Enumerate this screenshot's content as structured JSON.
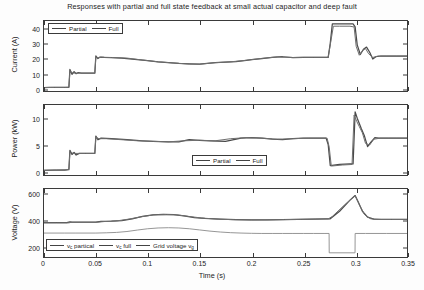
{
  "figure": {
    "title": "Responses with partial and full state feedback at small actual capacitor and deep fault",
    "xlabel": "Time (s)",
    "xticks": [
      "0",
      "0.05",
      "0.1",
      "0.15",
      "0.2",
      "0.25",
      "0.3",
      "0.35"
    ],
    "xlim": [
      0,
      0.35
    ],
    "colors": {
      "partial": "#4a4a4a",
      "full": "#6e6e6e",
      "grid": "#8a8a8a",
      "axis": "#3a3a3a"
    }
  },
  "chart_data": [
    {
      "type": "line",
      "id": "current",
      "title": "Responses with partial and full state feedback at small actual capacitor and deep fault",
      "xlabel": "Time (s)",
      "ylabel": "Current (A)",
      "xlim": [
        0,
        0.35
      ],
      "ylim": [
        -2,
        45
      ],
      "yticks": [
        0,
        10,
        20,
        30,
        40
      ],
      "grid": false,
      "legend_position": "top-left",
      "series": [
        {
          "name": "Partial",
          "x": [
            0,
            0.005,
            0.01,
            0.02,
            0.024,
            0.025,
            0.027,
            0.029,
            0.031,
            0.033,
            0.036,
            0.04,
            0.045,
            0.049,
            0.05,
            0.052,
            0.054,
            0.058,
            0.065,
            0.075,
            0.085,
            0.095,
            0.1,
            0.11,
            0.12,
            0.13,
            0.14,
            0.15,
            0.155,
            0.165,
            0.175,
            0.185,
            0.195,
            0.2,
            0.21,
            0.22,
            0.23,
            0.24,
            0.25,
            0.26,
            0.27,
            0.274,
            0.276,
            0.278,
            0.282,
            0.29,
            0.298,
            0.3,
            0.302,
            0.305,
            0.308,
            0.311,
            0.314,
            0.317,
            0.32,
            0.325,
            0.33,
            0.34,
            0.35
          ],
          "y": [
            0.3,
            0.4,
            0.4,
            0.4,
            0.5,
            12.5,
            9.2,
            11.0,
            9.6,
            10.3,
            10.0,
            10.0,
            10.0,
            10.0,
            21.5,
            19.8,
            20.8,
            20.6,
            20.4,
            20.0,
            19.4,
            18.8,
            18.4,
            17.6,
            17.0,
            16.5,
            16.2,
            16.0,
            16.4,
            17.0,
            17.4,
            17.8,
            18.6,
            19.0,
            19.8,
            20.6,
            21.0,
            20.4,
            20.6,
            20.6,
            20.6,
            20.6,
            30.0,
            43.0,
            43.0,
            43.0,
            43.0,
            41.0,
            29.0,
            22.5,
            26.0,
            27.5,
            24.0,
            19.5,
            21.0,
            21.5,
            21.5,
            21.5,
            21.5
          ]
        },
        {
          "name": "Full",
          "x": [
            0,
            0.01,
            0.02,
            0.024,
            0.025,
            0.027,
            0.03,
            0.035,
            0.045,
            0.049,
            0.05,
            0.052,
            0.055,
            0.065,
            0.08,
            0.095,
            0.11,
            0.125,
            0.14,
            0.15,
            0.165,
            0.18,
            0.195,
            0.21,
            0.225,
            0.24,
            0.25,
            0.26,
            0.27,
            0.274,
            0.276,
            0.279,
            0.285,
            0.295,
            0.299,
            0.301,
            0.304,
            0.307,
            0.31,
            0.313,
            0.317,
            0.322,
            0.33,
            0.34,
            0.35
          ],
          "y": [
            0.3,
            0.4,
            0.4,
            0.5,
            11.8,
            10.2,
            10.0,
            10.0,
            10.0,
            10.0,
            21.0,
            20.2,
            20.7,
            20.5,
            20.1,
            18.8,
            17.6,
            16.8,
            16.1,
            16.0,
            17.0,
            17.6,
            18.6,
            19.9,
            20.9,
            20.5,
            20.6,
            20.6,
            20.6,
            20.6,
            29.0,
            41.5,
            41.5,
            41.5,
            41.0,
            28.0,
            22.0,
            25.0,
            26.5,
            23.0,
            20.5,
            21.5,
            21.5,
            21.5,
            21.5
          ]
        }
      ]
    },
    {
      "type": "line",
      "id": "power",
      "xlabel": "Time (s)",
      "ylabel": "Power (kW)",
      "xlim": [
        0,
        0.35
      ],
      "ylim": [
        -0.8,
        12.5
      ],
      "yticks": [
        0,
        5,
        10
      ],
      "grid": false,
      "legend_position": "bottom-right",
      "series": [
        {
          "name": "Partial",
          "x": [
            0,
            0.01,
            0.02,
            0.024,
            0.025,
            0.027,
            0.029,
            0.031,
            0.034,
            0.04,
            0.047,
            0.049,
            0.05,
            0.052,
            0.055,
            0.065,
            0.08,
            0.095,
            0.105,
            0.12,
            0.13,
            0.14,
            0.15,
            0.16,
            0.175,
            0.19,
            0.2,
            0.21,
            0.22,
            0.23,
            0.24,
            0.25,
            0.26,
            0.268,
            0.272,
            0.274,
            0.276,
            0.285,
            0.295,
            0.298,
            0.3,
            0.302,
            0.304,
            0.306,
            0.309,
            0.312,
            0.315,
            0.319,
            0.323,
            0.33,
            0.34,
            0.35
          ],
          "y": [
            0.1,
            0.15,
            0.15,
            0.2,
            3.9,
            3.1,
            3.5,
            3.0,
            3.3,
            3.3,
            3.3,
            3.3,
            6.6,
            5.9,
            6.2,
            6.1,
            5.9,
            5.7,
            5.6,
            5.5,
            5.5,
            5.9,
            5.8,
            5.7,
            5.6,
            6.2,
            6.3,
            6.2,
            6.0,
            5.9,
            6.1,
            6.2,
            6.2,
            6.2,
            6.2,
            5.0,
            1.0,
            1.2,
            1.3,
            1.3,
            11.2,
            10.0,
            9.0,
            8.0,
            6.6,
            4.6,
            5.4,
            6.3,
            6.2,
            6.2,
            6.2,
            6.2
          ]
        },
        {
          "name": "Full",
          "x": [
            0,
            0.012,
            0.022,
            0.024,
            0.025,
            0.028,
            0.032,
            0.04,
            0.049,
            0.05,
            0.053,
            0.06,
            0.075,
            0.09,
            0.105,
            0.12,
            0.135,
            0.15,
            0.165,
            0.18,
            0.195,
            0.21,
            0.225,
            0.24,
            0.255,
            0.268,
            0.273,
            0.275,
            0.277,
            0.288,
            0.297,
            0.299,
            0.3015,
            0.304,
            0.307,
            0.31,
            0.314,
            0.318,
            0.324,
            0.332,
            0.34,
            0.35
          ],
          "y": [
            0.1,
            0.15,
            0.2,
            0.3,
            3.6,
            3.3,
            3.3,
            3.3,
            3.3,
            6.4,
            6.1,
            6.1,
            5.9,
            5.7,
            5.6,
            5.5,
            5.7,
            5.8,
            5.7,
            6.1,
            6.3,
            6.2,
            6.0,
            6.1,
            6.2,
            6.2,
            6.2,
            4.5,
            0.9,
            1.1,
            1.2,
            10.6,
            9.4,
            8.4,
            7.2,
            5.2,
            4.9,
            6.0,
            6.2,
            6.2,
            6.2,
            6.2
          ]
        }
      ]
    },
    {
      "type": "line",
      "id": "voltage",
      "xlabel": "Time (s)",
      "ylabel": "Voltage (V)",
      "xlim": [
        0,
        0.35
      ],
      "ylim": [
        120,
        640
      ],
      "yticks": [
        200,
        400,
        600
      ],
      "grid": false,
      "legend_position": "bottom-left",
      "series": [
        {
          "name": "v_c partical",
          "label_main": "v",
          "label_sub": "c",
          "label_tail": " partical",
          "x": [
            0,
            0.01,
            0.022,
            0.025,
            0.027,
            0.035,
            0.05,
            0.055,
            0.065,
            0.075,
            0.085,
            0.095,
            0.105,
            0.115,
            0.125,
            0.135,
            0.145,
            0.155,
            0.17,
            0.185,
            0.2,
            0.215,
            0.23,
            0.245,
            0.26,
            0.272,
            0.276,
            0.285,
            0.295,
            0.3,
            0.303,
            0.307,
            0.312,
            0.318,
            0.33,
            0.34,
            0.35
          ],
          "y": [
            383,
            383,
            383,
            388,
            386,
            386,
            386,
            392,
            394,
            398,
            412,
            430,
            443,
            446,
            444,
            435,
            422,
            415,
            410,
            406,
            404,
            404,
            406,
            408,
            410,
            412,
            412,
            470,
            555,
            590,
            540,
            470,
            425,
            410,
            408,
            408,
            408
          ]
        },
        {
          "name": "v_c full",
          "label_main": "v",
          "label_sub": "c",
          "label_tail": " full",
          "x": [
            0,
            0.012,
            0.024,
            0.026,
            0.034,
            0.05,
            0.058,
            0.07,
            0.082,
            0.094,
            0.106,
            0.118,
            0.128,
            0.14,
            0.152,
            0.168,
            0.184,
            0.2,
            0.216,
            0.232,
            0.248,
            0.262,
            0.274,
            0.278,
            0.29,
            0.3,
            0.304,
            0.309,
            0.315,
            0.325,
            0.335,
            0.35
          ],
          "y": [
            381,
            381,
            381,
            385,
            385,
            385,
            391,
            396,
            410,
            428,
            442,
            445,
            442,
            430,
            418,
            409,
            405,
            403,
            404,
            406,
            408,
            410,
            411,
            430,
            520,
            588,
            520,
            445,
            412,
            407,
            407,
            407
          ]
        },
        {
          "name": "Grid voltage v_g",
          "label_main": "Grid voltage v",
          "label_sub": "g",
          "label_tail": "",
          "x": [
            0,
            0.02,
            0.03,
            0.05,
            0.06,
            0.07,
            0.08,
            0.09,
            0.1,
            0.11,
            0.12,
            0.13,
            0.14,
            0.15,
            0.16,
            0.17,
            0.18,
            0.19,
            0.2,
            0.21,
            0.22,
            0.23,
            0.24,
            0.25,
            0.26,
            0.27,
            0.2749,
            0.275,
            0.299,
            0.2999,
            0.3,
            0.31,
            0.33,
            0.35
          ],
          "y": [
            303,
            303,
            303,
            303,
            305,
            308,
            315,
            326,
            336,
            342,
            344,
            342,
            336,
            327,
            318,
            311,
            306,
            303,
            301,
            300,
            300,
            300,
            300,
            300,
            300,
            300,
            300,
            152,
            152,
            152,
            300,
            300,
            300,
            300
          ]
        }
      ]
    }
  ],
  "panels": {
    "current": {
      "ylabel": "Current (A)",
      "yticks": [
        "0",
        "10",
        "20",
        "30",
        "40"
      ],
      "legend": [
        {
          "label": "Partial"
        },
        {
          "label": "Full"
        }
      ]
    },
    "power": {
      "ylabel": "Power (kW)",
      "yticks": [
        "0",
        "5",
        "10"
      ],
      "legend": [
        {
          "label": "Partial"
        },
        {
          "label": "Full"
        }
      ]
    },
    "voltage": {
      "ylabel": "Voltage (V)",
      "yticks": [
        "200",
        "400",
        "600"
      ],
      "legend": [
        {
          "main": "v",
          "sub": "c",
          "tail": " partical"
        },
        {
          "main": "v",
          "sub": "c",
          "tail": " full"
        },
        {
          "main": "Grid voltage v",
          "sub": "g",
          "tail": ""
        }
      ]
    }
  }
}
